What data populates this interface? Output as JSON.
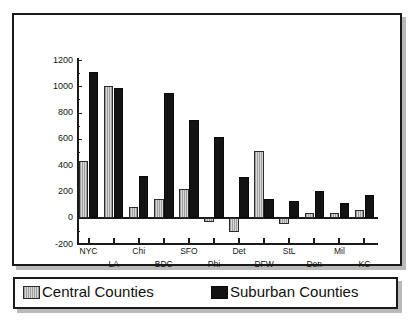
{
  "chart_data": {
    "type": "bar",
    "title": "",
    "xlabel": "",
    "ylabel": "Number in thousands",
    "categories": [
      "NYC",
      "LA",
      "Chi",
      "BDC",
      "SFO",
      "Phi",
      "Det",
      "DFW",
      "StL",
      "Den",
      "Mil",
      "KC"
    ],
    "series": [
      {
        "name": "Central Counties",
        "color": "#b5b5b5",
        "values": [
          435,
          1000,
          85,
          145,
          215,
          -35,
          -105,
          510,
          -45,
          35,
          33,
          55
        ]
      },
      {
        "name": "Suburban Counties",
        "color": "#131313",
        "values": [
          1110,
          990,
          315,
          950,
          740,
          615,
          310,
          140,
          125,
          200,
          115,
          170
        ]
      }
    ],
    "ylim": [
      -200,
      1200
    ],
    "ytick_labels": [
      "1200",
      "1000",
      "800",
      "600",
      "400",
      "200",
      "0",
      "-200"
    ],
    "ytick_values": [
      1200,
      1000,
      800,
      600,
      400,
      200,
      0,
      -200
    ],
    "grid": false,
    "legend_position": "bottom"
  },
  "legend": {
    "entries": [
      {
        "label": "Central Counties",
        "swatch": "central"
      },
      {
        "label": "Suburban Counties",
        "swatch": "suburban"
      }
    ]
  }
}
